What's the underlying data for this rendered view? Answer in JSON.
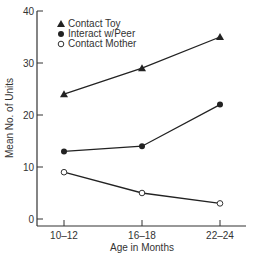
{
  "chart_data": {
    "type": "line",
    "title": "",
    "xlabel": "Age in Months",
    "ylabel": "Mean No. of Units",
    "categories": [
      "10–12",
      "16–18",
      "22–24"
    ],
    "ylim": [
      0,
      40
    ],
    "yticks": [
      0,
      10,
      20,
      30,
      40
    ],
    "grid": false,
    "legend_position": "top-left",
    "series": [
      {
        "name": "Contact Toy",
        "marker": "triangle-filled",
        "values": [
          24,
          29,
          35
        ]
      },
      {
        "name": "Interact w/Peer",
        "marker": "circle-filled",
        "values": [
          13,
          14,
          22
        ]
      },
      {
        "name": "Contact Mother",
        "marker": "circle-open",
        "values": [
          9,
          5,
          3
        ]
      }
    ]
  }
}
